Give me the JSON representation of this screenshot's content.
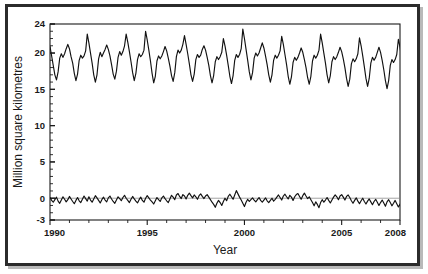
{
  "chart_data": {
    "type": "line",
    "title": "",
    "xlabel": "Year",
    "ylabel": "Million square kilometres",
    "xlim": [
      1990,
      2008
    ],
    "ylim": [
      -3,
      24
    ],
    "grid": false,
    "legend": "none",
    "x_ticks_major": [
      1990,
      1995,
      2000,
      2005,
      2008
    ],
    "x_tick_labels": [
      "1990",
      "1995",
      "2000",
      "2005",
      "2008"
    ],
    "x_ticks_minor_step": 1,
    "y_ticks_major": [
      -3,
      0,
      5,
      10,
      15,
      20,
      24
    ],
    "y_tick_labels": [
      "-3",
      "0",
      "5",
      "10",
      "15",
      "20",
      "24"
    ],
    "y_ticks_minor_step": 1,
    "annotations": [
      "Upper trace: monthly global sea ice extent, seasonal cycle",
      "Lower trace: monthly anomaly about the 0 reference line"
    ],
    "reference_lines": [
      {
        "axis": "y",
        "value": 0,
        "color": "#9a9a9a"
      }
    ],
    "series": [
      {
        "name": "Global sea ice extent",
        "ylabel": "Million square kilometres",
        "x_start": 1990.0,
        "x_step": 0.0833333,
        "values": [
          20.9,
          19.6,
          18.3,
          17.0,
          16.3,
          17.4,
          19.3,
          19.9,
          19.4,
          19.9,
          20.6,
          21.2,
          20.6,
          19.5,
          18.6,
          17.2,
          16.2,
          17.1,
          19.0,
          19.7,
          19.3,
          19.6,
          20.3,
          22.6,
          21.4,
          20.0,
          18.6,
          17.0,
          16.0,
          17.0,
          19.2,
          20.1,
          19.5,
          20.0,
          20.5,
          21.1,
          20.5,
          19.6,
          18.4,
          17.1,
          16.4,
          17.5,
          19.4,
          20.2,
          19.7,
          20.2,
          21.0,
          22.6,
          21.5,
          20.2,
          18.8,
          17.3,
          16.2,
          17.2,
          19.1,
          19.9,
          19.5,
          19.8,
          20.4,
          23.0,
          21.8,
          20.4,
          18.9,
          17.2,
          15.9,
          16.8,
          18.9,
          19.6,
          19.2,
          19.6,
          20.2,
          20.9,
          20.3,
          19.3,
          18.2,
          16.9,
          16.1,
          17.3,
          19.5,
          20.4,
          20.0,
          20.4,
          21.2,
          22.4,
          21.2,
          19.9,
          18.5,
          17.0,
          16.1,
          17.1,
          19.1,
          19.8,
          19.4,
          19.7,
          20.5,
          21.0,
          20.4,
          19.4,
          18.3,
          16.9,
          15.9,
          16.9,
          18.8,
          19.5,
          19.1,
          19.5,
          20.1,
          22.0,
          21.0,
          19.7,
          18.3,
          16.8,
          15.8,
          16.9,
          19.0,
          19.8,
          19.4,
          19.8,
          20.6,
          23.3,
          22.0,
          20.5,
          19.0,
          17.4,
          16.3,
          17.3,
          19.3,
          20.0,
          19.6,
          20.0,
          20.7,
          21.4,
          20.7,
          19.6,
          18.4,
          17.0,
          16.0,
          17.0,
          19.0,
          19.7,
          19.3,
          19.7,
          20.3,
          22.3,
          21.2,
          19.8,
          18.4,
          16.8,
          15.7,
          16.7,
          18.7,
          19.4,
          19.0,
          19.4,
          20.0,
          20.7,
          20.1,
          19.1,
          18.0,
          16.6,
          15.7,
          16.8,
          18.9,
          19.7,
          19.3,
          19.7,
          20.4,
          22.6,
          21.4,
          20.0,
          18.6,
          17.0,
          15.9,
          16.9,
          18.8,
          19.5,
          19.1,
          19.5,
          20.1,
          20.8,
          20.2,
          19.2,
          18.0,
          16.5,
          15.4,
          16.4,
          18.5,
          19.2,
          18.8,
          19.2,
          19.9,
          22.1,
          21.0,
          19.6,
          18.1,
          16.5,
          15.4,
          16.5,
          18.6,
          19.4,
          19.0,
          19.4,
          20.1,
          20.8,
          20.1,
          19.0,
          17.7,
          16.2,
          15.1,
          16.2,
          18.3,
          19.1,
          18.7,
          19.1,
          19.8,
          21.9,
          20.8,
          19.4
        ]
      },
      {
        "name": "Sea ice extent anomaly",
        "ylabel": "Million square kilometres",
        "x_start": 1990.0,
        "x_step": 0.0833333,
        "values": [
          0.1,
          -0.3,
          -0.55,
          -0.2,
          0.15,
          -0.4,
          -0.7,
          -0.25,
          0.2,
          -0.15,
          -0.5,
          -0.2,
          0.25,
          -0.1,
          -0.45,
          -0.75,
          -0.3,
          0.1,
          -0.35,
          -0.6,
          -0.15,
          0.3,
          -0.05,
          -0.4,
          0.2,
          -0.25,
          -0.55,
          -0.1,
          0.35,
          0.05,
          -0.3,
          -0.65,
          -0.2,
          0.15,
          -0.25,
          -0.5,
          0.05,
          0.3,
          -0.1,
          -0.45,
          -0.7,
          -0.25,
          0.2,
          -0.05,
          -0.35,
          0.1,
          0.4,
          0.0,
          -0.3,
          -0.6,
          -0.15,
          0.25,
          -0.1,
          -0.4,
          -0.65,
          -0.2,
          0.15,
          -0.3,
          -0.55,
          0.0,
          0.35,
          0.05,
          -0.25,
          -0.5,
          -0.8,
          -0.35,
          0.1,
          -0.2,
          -0.45,
          0.05,
          0.3,
          -0.05,
          -0.35,
          -0.6,
          -0.1,
          0.4,
          0.15,
          -0.2,
          0.45,
          0.65,
          0.25,
          -0.05,
          0.5,
          0.3,
          -0.1,
          0.4,
          0.7,
          0.35,
          0.05,
          0.45,
          0.2,
          -0.15,
          0.35,
          0.6,
          0.25,
          -0.05,
          0.3,
          0.5,
          0.15,
          -0.2,
          -0.55,
          -0.85,
          -1.25,
          -0.7,
          -0.3,
          -0.6,
          -1.0,
          -0.45,
          0.0,
          -0.35,
          0.25,
          0.55,
          0.2,
          -0.15,
          0.45,
          1.05,
          0.6,
          0.15,
          -0.25,
          -0.7,
          -1.15,
          -0.55,
          -0.15,
          -0.45,
          -0.2,
          0.05,
          -0.25,
          -0.5,
          -0.2,
          0.1,
          -0.3,
          -0.55,
          -0.25,
          0.05,
          -0.35,
          -0.6,
          -0.3,
          0.0,
          -0.4,
          -0.15,
          0.15,
          0.45,
          0.1,
          -0.25,
          0.3,
          0.55,
          0.2,
          -0.1,
          0.4,
          0.15,
          -0.3,
          0.2,
          0.5,
          0.65,
          0.25,
          -0.15,
          0.35,
          0.7,
          0.3,
          -0.05,
          0.2,
          -0.2,
          -0.6,
          -1.05,
          -0.5,
          -0.85,
          -1.3,
          -0.6,
          -0.2,
          -0.55,
          -0.25,
          0.1,
          -0.3,
          -0.65,
          -0.25,
          0.15,
          0.45,
          0.2,
          -0.2,
          0.3,
          0.5,
          0.15,
          -0.25,
          0.25,
          0.45,
          0.1,
          -0.35,
          -0.7,
          -0.3,
          0.05,
          -0.4,
          -0.75,
          -0.35,
          0.0,
          -0.45,
          -0.8,
          -0.4,
          -0.1,
          -0.5,
          -0.9,
          -0.45,
          -0.15,
          -0.55,
          -1.0,
          -0.6,
          -0.25,
          -0.65,
          -1.1,
          -0.5,
          -0.2,
          -0.6,
          -1.05,
          -0.7,
          -0.3,
          -0.75,
          -1.2,
          -0.85,
          -0.4,
          -0.95,
          -1.45,
          -0.8,
          -0.35,
          -0.9,
          -1.4,
          -1.75,
          -0.95,
          1.05,
          0.4
        ]
      }
    ]
  },
  "axis": {
    "x_title": "Year",
    "y_title": "Million square kilometres"
  }
}
